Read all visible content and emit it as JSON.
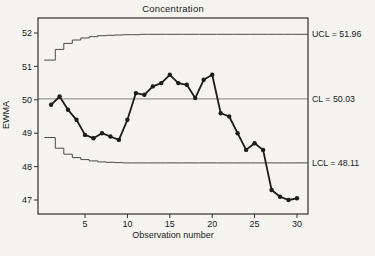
{
  "title": "Concentration",
  "x_axis": {
    "label": "Observation number",
    "ticks": [
      5,
      10,
      15,
      20,
      25,
      30
    ]
  },
  "y_axis": {
    "label": "EWMA",
    "ticks": [
      47,
      48,
      49,
      50,
      51,
      52
    ]
  },
  "limit_labels": {
    "ucl": "UCL = 51.96",
    "cl": "CL = 50.03",
    "lcl": "LCL = 48.11"
  },
  "chart_data": {
    "type": "line",
    "subtype": "ewma-control-chart",
    "title": "Concentration",
    "xlabel": "Observation number",
    "ylabel": "EWMA",
    "xlim": [
      0,
      31.3
    ],
    "ylim": [
      46.6,
      52.45
    ],
    "grid": false,
    "ucl": 51.96,
    "cl": 50.03,
    "lcl": 48.11,
    "x": [
      1,
      2,
      3,
      4,
      5,
      6,
      7,
      8,
      9,
      10,
      11,
      12,
      13,
      14,
      15,
      16,
      17,
      18,
      19,
      20,
      21,
      22,
      23,
      24,
      25,
      26,
      27,
      28,
      29,
      30
    ],
    "ewma": [
      49.85,
      50.1,
      49.7,
      49.4,
      48.95,
      48.85,
      49.0,
      48.9,
      48.8,
      49.4,
      50.2,
      50.15,
      50.4,
      50.5,
      50.75,
      50.5,
      50.45,
      50.05,
      50.6,
      50.75,
      49.6,
      49.5,
      49.0,
      48.5,
      48.7,
      48.5,
      47.3,
      47.1,
      47.0,
      47.05
    ],
    "ucl_steps": [
      51.19,
      51.51,
      51.69,
      51.79,
      51.85,
      51.89,
      51.92,
      51.93,
      51.94,
      51.95,
      51.95,
      51.96,
      51.96,
      51.96,
      51.96,
      51.96,
      51.96,
      51.96,
      51.96,
      51.96,
      51.96,
      51.96,
      51.96,
      51.96,
      51.96,
      51.96,
      51.96,
      51.96,
      51.96,
      51.96
    ],
    "lcl_steps": [
      48.87,
      48.55,
      48.37,
      48.27,
      48.21,
      48.17,
      48.14,
      48.13,
      48.12,
      48.11,
      48.11,
      48.11,
      48.11,
      48.11,
      48.11,
      48.11,
      48.11,
      48.11,
      48.11,
      48.11,
      48.11,
      48.11,
      48.11,
      48.11,
      48.11,
      48.11,
      48.11,
      48.11,
      48.11,
      48.11
    ],
    "colors": {
      "series": "#1c1c1c",
      "center_line": "#9a9a9a",
      "limit_lines": "#4a4a4a",
      "frame": "#2f2f2f",
      "background": "#f5f4f0"
    }
  }
}
